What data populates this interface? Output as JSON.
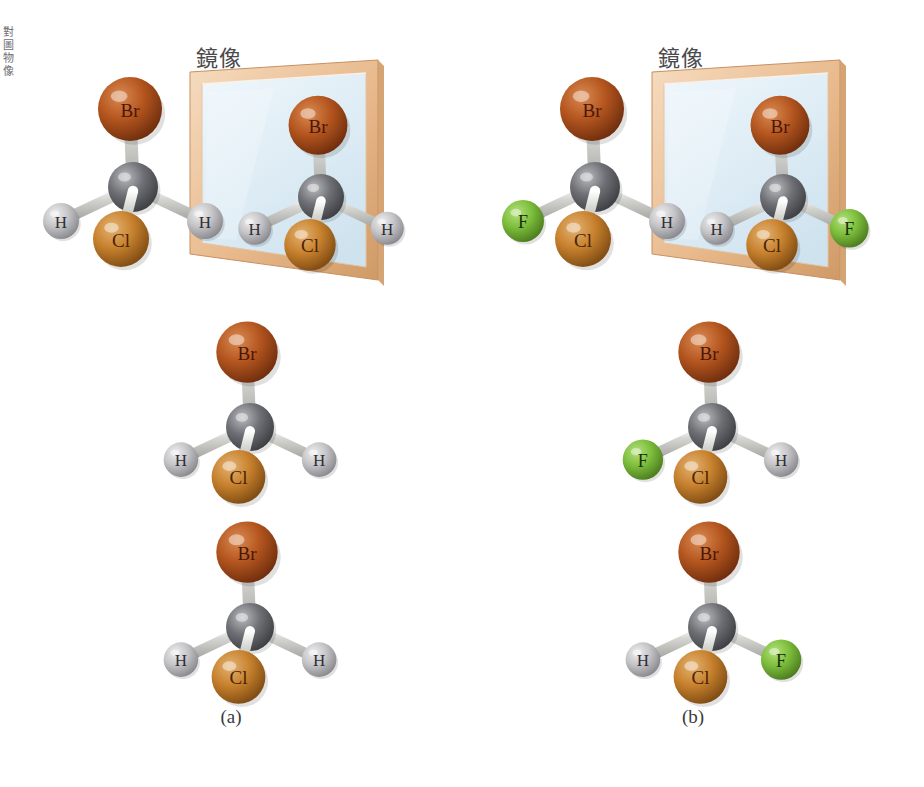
{
  "figure": {
    "margin_text": "對圖物像",
    "mirror_label": "鏡像",
    "captions": {
      "a": "(a)",
      "b": "(b)"
    }
  },
  "atoms": {
    "Br": {
      "symbol": "Br",
      "color": "#b5561f",
      "highlight": "#d98a52",
      "shadow": "#6e2d0d",
      "radius": 32
    },
    "Cl": {
      "symbol": "Cl",
      "color": "#c8822e",
      "highlight": "#e3b273",
      "shadow": "#7d4a12",
      "radius": 28
    },
    "H": {
      "symbol": "H",
      "color": "#c5c5c8",
      "highlight": "#eeeef0",
      "shadow": "#86868c",
      "radius": 18
    },
    "F": {
      "symbol": "F",
      "color": "#7dbe3c",
      "highlight": "#b3e07c",
      "shadow": "#4b7a1e",
      "radius": 21
    },
    "C": {
      "symbol": "",
      "color": "#6e7075",
      "highlight": "#b9bbbf",
      "shadow": "#3c3e42",
      "radius": 25
    }
  },
  "colors": {
    "bond": "#d5d5d2",
    "bond_shadow": "#a2a29e",
    "mirror_frame_light": "#f6dcc0",
    "mirror_frame_mid": "#e8b98c",
    "mirror_frame_dark": "#cf9a66",
    "mirror_glass_top": "#eef6fb",
    "mirror_glass_bottom": "#cfe3ef",
    "background": "#ffffff"
  },
  "panels": [
    {
      "id": "a",
      "caption": "(a)",
      "molecule_formula": "CH2BrCl",
      "mirror_label": "鏡像",
      "rows": [
        {
          "name": "original-and-mirror",
          "original": {
            "name": "molecule-a-original",
            "substituents": {
              "top": "Br",
              "left": "H",
              "right": "H",
              "front": "Cl"
            }
          },
          "reflection": {
            "name": "molecule-a-reflection",
            "substituents": {
              "top": "Br",
              "left": "H",
              "right": "H",
              "front": "Cl"
            }
          }
        },
        {
          "name": "middle-row",
          "original": {
            "name": "molecule-a-middle",
            "substituents": {
              "top": "Br",
              "left": "H",
              "right": "H",
              "front": "Cl"
            }
          }
        },
        {
          "name": "bottom-row",
          "original": {
            "name": "molecule-a-bottom",
            "substituents": {
              "top": "Br",
              "left": "H",
              "right": "H",
              "front": "Cl"
            }
          }
        }
      ]
    },
    {
      "id": "b",
      "caption": "(b)",
      "molecule_formula": "CHBrClF",
      "mirror_label": "鏡像",
      "rows": [
        {
          "name": "original-and-mirror",
          "original": {
            "name": "molecule-b-original",
            "substituents": {
              "top": "Br",
              "left": "F",
              "right": "H",
              "front": "Cl"
            }
          },
          "reflection": {
            "name": "molecule-b-reflection",
            "substituents": {
              "top": "Br",
              "left": "H",
              "right": "F",
              "front": "Cl"
            }
          }
        },
        {
          "name": "middle-row",
          "original": {
            "name": "molecule-b-middle",
            "substituents": {
              "top": "Br",
              "left": "F",
              "right": "H",
              "front": "Cl"
            }
          }
        },
        {
          "name": "bottom-row",
          "original": {
            "name": "molecule-b-bottom",
            "substituents": {
              "top": "Br",
              "left": "H",
              "right": "F",
              "front": "Cl"
            }
          }
        }
      ]
    }
  ]
}
